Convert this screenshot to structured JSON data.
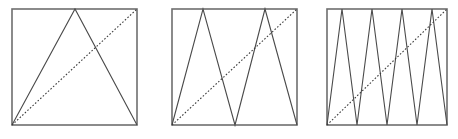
{
  "figure": {
    "title": "",
    "caption": "",
    "background_color": "#ffffff",
    "frame_color": "#6e6e6e",
    "wave_color": "#4a4a4a",
    "diagonal_color": "#3c3c3c",
    "panel_count": 3
  },
  "chart_data": {
    "type": "line",
    "title": "",
    "subtitle": "",
    "xlabel": "",
    "ylabel": "",
    "xlim": [
      0,
      1
    ],
    "ylim": [
      0,
      1
    ],
    "grid": false,
    "legend": "none",
    "annotations": [],
    "panels": [
      {
        "name": "panel-1",
        "label": "",
        "peaks": 1,
        "frame": {
          "x0": 12,
          "y0": 9,
          "x1": 137,
          "y1": 125
        },
        "series": [
          {
            "name": "tent-map-iterate-1",
            "kind": "zigzag",
            "style": "solid",
            "points_norm": [
              [
                0.0,
                0.0
              ],
              [
                0.5,
                1.0
              ],
              [
                1.0,
                0.0
              ]
            ],
            "points_px": [
              [
                12,
                125
              ],
              [
                75,
                9
              ],
              [
                137,
                125
              ]
            ]
          },
          {
            "name": "identity-diagonal",
            "kind": "line",
            "style": "dashed",
            "points_norm": [
              [
                0.0,
                0.0
              ],
              [
                1.0,
                1.0
              ]
            ],
            "points_px": [
              [
                12,
                125
              ],
              [
                137,
                9
              ]
            ]
          }
        ]
      },
      {
        "name": "panel-2",
        "label": "",
        "peaks": 2,
        "frame": {
          "x0": 172,
          "y0": 9,
          "x1": 297,
          "y1": 125
        },
        "series": [
          {
            "name": "tent-map-iterate-2",
            "kind": "zigzag",
            "style": "solid",
            "points_norm": [
              [
                0.0,
                0.0
              ],
              [
                0.25,
                1.0
              ],
              [
                0.5,
                0.0
              ],
              [
                0.75,
                1.0
              ],
              [
                1.0,
                0.0
              ]
            ],
            "points_px": [
              [
                172,
                125
              ],
              [
                203,
                9
              ],
              [
                235,
                125
              ],
              [
                265,
                9
              ],
              [
                297,
                125
              ]
            ]
          },
          {
            "name": "identity-diagonal",
            "kind": "line",
            "style": "dashed",
            "points_norm": [
              [
                0.0,
                0.0
              ],
              [
                1.0,
                1.0
              ]
            ],
            "points_px": [
              [
                172,
                125
              ],
              [
                297,
                9
              ]
            ]
          }
        ]
      },
      {
        "name": "panel-3",
        "label": "",
        "peaks": 4,
        "frame": {
          "x0": 327,
          "y0": 9,
          "x1": 447,
          "y1": 125
        },
        "series": [
          {
            "name": "tent-map-iterate-3",
            "kind": "zigzag",
            "style": "solid",
            "points_norm": [
              [
                0.0,
                0.0
              ],
              [
                0.125,
                1.0
              ],
              [
                0.25,
                0.0
              ],
              [
                0.375,
                1.0
              ],
              [
                0.5,
                0.0
              ],
              [
                0.625,
                1.0
              ],
              [
                0.75,
                0.0
              ],
              [
                0.875,
                1.0
              ],
              [
                1.0,
                0.0
              ]
            ],
            "points_px": [
              [
                327,
                125
              ],
              [
                342,
                9
              ],
              [
                357,
                125
              ],
              [
                372,
                9
              ],
              [
                387,
                125
              ],
              [
                402,
                9
              ],
              [
                417,
                125
              ],
              [
                432,
                9
              ],
              [
                447,
                125
              ]
            ]
          },
          {
            "name": "identity-diagonal",
            "kind": "line",
            "style": "dashed",
            "points_norm": [
              [
                0.0,
                0.0
              ],
              [
                1.0,
                1.0
              ]
            ],
            "points_px": [
              [
                327,
                125
              ],
              [
                447,
                9
              ]
            ]
          }
        ]
      }
    ]
  }
}
